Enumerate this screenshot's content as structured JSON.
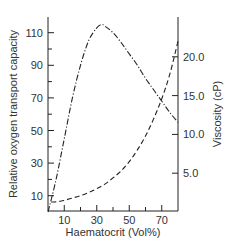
{
  "chart_data": {
    "type": "line",
    "title": "",
    "xlabel": "Haematocrit (Vol%)",
    "ylabel": "Relative oxygen transport capacity",
    "y2label": "Viscosity (cP)",
    "xlim": [
      0,
      80
    ],
    "ylim": [
      0,
      120
    ],
    "y2lim": [
      0,
      24.5
    ],
    "x_ticks": [
      10,
      30,
      50,
      70
    ],
    "x_minor_ticks": [
      20,
      40,
      60
    ],
    "y_ticks": [
      10,
      30,
      50,
      70,
      90,
      110
    ],
    "y_minor_ticks": [
      20,
      40,
      60,
      80,
      100
    ],
    "y2_ticks": [
      "5.0",
      "10.0",
      "15.0",
      "20.0"
    ],
    "grid": false,
    "legend": null,
    "series": [
      {
        "name": "Relative oxygen transport capacity",
        "axis": "left",
        "style": "dash-dot",
        "x": [
          0,
          5,
          10,
          15,
          20,
          25,
          30,
          33,
          35,
          40,
          45,
          50,
          55,
          60,
          65,
          70,
          75,
          80
        ],
        "values": [
          0,
          20,
          45,
          70,
          90,
          105,
          113,
          115,
          114,
          110,
          104,
          97,
          90,
          82,
          75,
          68,
          61,
          55
        ]
      },
      {
        "name": "Viscosity",
        "axis": "right",
        "style": "dashed",
        "x": [
          2,
          5,
          10,
          15,
          20,
          25,
          30,
          35,
          40,
          45,
          50,
          55,
          60,
          65,
          70,
          75,
          80
        ],
        "values": [
          1.3,
          1.3,
          1.5,
          1.8,
          2.1,
          2.5,
          3.0,
          3.6,
          4.4,
          5.3,
          6.5,
          8.0,
          9.8,
          12.0,
          14.6,
          17.8,
          22.0
        ]
      }
    ]
  }
}
